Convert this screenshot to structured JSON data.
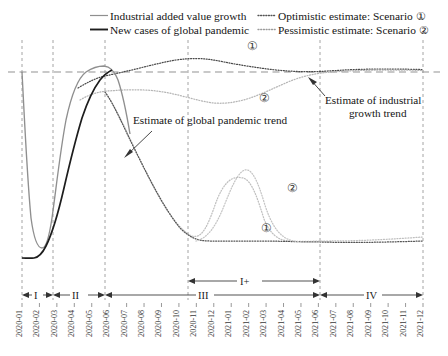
{
  "chart_data": {
    "type": "line",
    "title": "",
    "xlabel": "",
    "ylabel": "",
    "grid": true,
    "legend_position": "top",
    "xlim": [
      "2020-01",
      "2021-12"
    ],
    "x": [
      "2020-01",
      "2020-02",
      "2020-03",
      "2020-04",
      "2020-05",
      "2020-06",
      "2020-07",
      "2020-08",
      "2020-09",
      "2020-10",
      "2020-11",
      "2020-12",
      "2021-01",
      "2021-02",
      "2021-03",
      "2021-04",
      "2021-05",
      "2021-06",
      "2021-07",
      "2021-08",
      "2021-09",
      "2021-10",
      "2021-11",
      "2021-12"
    ],
    "reference_line_label": "pre-pandemic trend level",
    "series": [
      {
        "name": "Industrial added value growth",
        "style": "solid-light",
        "color": "#8f8f8f",
        "observed_through": "2020-05",
        "values": [
          72,
          245,
          88,
          72,
          76,
          null,
          null,
          null,
          null,
          null,
          null,
          null,
          null,
          null,
          null,
          null,
          null,
          null,
          null,
          null,
          null,
          null,
          null,
          null
        ]
      },
      {
        "name": "New cases of global pandemic",
        "style": "solid-dark",
        "color": "#1d1d1d",
        "observed_through": "2020-05",
        "values": [
          258,
          258,
          250,
          176,
          92,
          null,
          null,
          null,
          null,
          null,
          null,
          null,
          null,
          null,
          null,
          null,
          null,
          null,
          null,
          null,
          null,
          null,
          null,
          null
        ]
      },
      {
        "name": "Optimistic estimate: Scenario ①",
        "style": "dotted",
        "color": "#555555",
        "marker_label": "①",
        "applies_to": "industrial growth estimate (upper) and pandemic estimate (lower)",
        "industrial_values": [
          null,
          null,
          null,
          null,
          86,
          78,
          74,
          70,
          66,
          62,
          60,
          58,
          56,
          58,
          60,
          62,
          64,
          66,
          66,
          66,
          66,
          66,
          66,
          66
        ],
        "pandemic_values": [
          null,
          null,
          null,
          null,
          92,
          120,
          152,
          180,
          202,
          218,
          228,
          236,
          240,
          241,
          241,
          240,
          240,
          240,
          241,
          243,
          244,
          244,
          243,
          241
        ]
      },
      {
        "name": "Pessimistic estimate: Scenario ②",
        "style": "dotted-light",
        "color": "#a8a8a8",
        "marker_label": "②",
        "applies_to": "industrial growth estimate (lower) and pandemic estimate (upper)",
        "industrial_values": [
          null,
          null,
          null,
          null,
          98,
          92,
          88,
          90,
          94,
          98,
          100,
          102,
          100,
          96,
          90,
          84,
          78,
          74,
          72,
          72,
          73,
          74,
          75,
          76
        ],
        "pandemic_values": [
          null,
          null,
          null,
          null,
          92,
          130,
          166,
          196,
          214,
          226,
          232,
          226,
          208,
          178,
          175,
          200,
          224,
          236,
          240,
          240,
          239,
          238,
          237,
          236
        ]
      }
    ],
    "annotations": [
      {
        "text": "Estimate of global pandemic trend",
        "target": "pandemic dotted curves"
      },
      {
        "text": "Estimate of industrial growth trend",
        "target": "industrial dotted curves"
      }
    ],
    "phase_markers_lower": [
      {
        "label": "I",
        "from": "2020-01",
        "to": "2020-03"
      },
      {
        "label": "II",
        "from": "2020-03",
        "to": "2020-06"
      },
      {
        "label": "III",
        "from": "2020-06",
        "to": "2021-06"
      },
      {
        "label": "IV",
        "from": "2021-06",
        "to": "2021-12"
      }
    ],
    "phase_markers_upper": [
      {
        "label": "I+",
        "from": "2020-11",
        "to": "2021-06"
      }
    ]
  },
  "legend": {
    "entries": [
      {
        "label": "Industrial added value growth",
        "swatch": "solid-light-line",
        "color": "#8f8f8f"
      },
      {
        "label": "Optimistic estimate: Scenario ①",
        "swatch": "dotted-line",
        "color": "#555555"
      },
      {
        "label": "New cases of global pandemic",
        "swatch": "solid-dark-line",
        "color": "#1d1d1d"
      },
      {
        "label": "Pessimistic estimate: Scenario ②",
        "swatch": "dotted-light-line",
        "color": "#a8a8a8"
      }
    ]
  },
  "annotations": {
    "pandemic": "Estimate of global pandemic trend",
    "industrial_line1": "Estimate of industrial",
    "industrial_line2": "growth trend"
  },
  "curve_labels": {
    "industrial_optimistic": "①",
    "industrial_pessimistic": "②",
    "pandemic_pessimistic": "②",
    "pandemic_optimistic": "①"
  },
  "phases": {
    "p1": "I",
    "p2": "II",
    "p3": "III",
    "p4": "IV",
    "p_plus": "I+"
  },
  "axis": {
    "ticks": [
      "2020-01",
      "2020-02",
      "2020-03",
      "2020-04",
      "2020-05",
      "2020-06",
      "2020-07",
      "2020-08",
      "2020-09",
      "2020-10",
      "2020-11",
      "2020-12",
      "2021-01",
      "2021-02",
      "2021-03",
      "2021-04",
      "2021-05",
      "2021-06",
      "2021-07",
      "2021-08",
      "2021-09",
      "2021-10",
      "2021-11",
      "2021-12"
    ]
  },
  "colors": {
    "solid_light": "#8f8f8f",
    "solid_dark": "#1d1d1d",
    "dotted_dark": "#555555",
    "dotted_light": "#a8a8a8",
    "gridline": "#9a9a9a",
    "text": "#141414"
  }
}
